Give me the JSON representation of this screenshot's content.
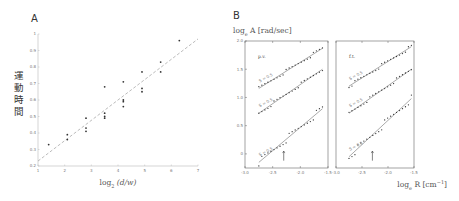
{
  "chart_data": [
    {
      "panel": "A",
      "type": "scatter",
      "title": "",
      "xlabel": "log2 (d/w)",
      "ylabel": "運動時間",
      "xlim": [
        1,
        7
      ],
      "ylim": [
        0.2,
        1.0
      ],
      "xticks": [
        "1",
        "2",
        "3",
        "4",
        "5",
        "6",
        "7"
      ],
      "yticks": [
        "0.2",
        "0.3",
        "0.4",
        "0.5",
        "0.6",
        "0.7",
        "0.8",
        "0.9",
        "1"
      ],
      "grid": false,
      "series": [
        {
          "name": "data",
          "points": [
            [
              1.4,
              0.33
            ],
            [
              2.1,
              0.39
            ],
            [
              2.1,
              0.36
            ],
            [
              2.8,
              0.49
            ],
            [
              2.8,
              0.43
            ],
            [
              2.8,
              0.41
            ],
            [
              3.5,
              0.68
            ],
            [
              3.5,
              0.52
            ],
            [
              3.5,
              0.5
            ],
            [
              3.5,
              0.49
            ],
            [
              4.2,
              0.71
            ],
            [
              4.2,
              0.6
            ],
            [
              4.2,
              0.59
            ],
            [
              4.2,
              0.56
            ],
            [
              4.9,
              0.77
            ],
            [
              4.9,
              0.67
            ],
            [
              4.9,
              0.65
            ],
            [
              5.6,
              0.83
            ],
            [
              5.6,
              0.77
            ],
            [
              6.3,
              0.96
            ]
          ]
        },
        {
          "name": "fit",
          "style": "dashed",
          "line": [
            [
              1,
              0.23
            ],
            [
              7,
              0.97
            ]
          ]
        }
      ]
    },
    {
      "panel": "B",
      "type": "scatter",
      "ylabel": "log_e A [rad/sec]",
      "xlabel": "log_e R [cm^-1]",
      "ylim": [
        -0.25,
        2.0
      ],
      "yticks": [
        "0",
        "0.5",
        "1.0",
        "1.5",
        "2.0"
      ],
      "subplots": [
        {
          "label": "p.v.",
          "xlim": [
            -3.0,
            -1.5
          ],
          "xticks": [
            "-3.0",
            "-2.5",
            "-2.0",
            "-1.5"
          ],
          "series": [
            {
              "name": "S = 0.5 (top)",
              "line": [
                [
                  -2.75,
                  1.16
                ],
                [
                  -1.6,
                  1.87
                ]
              ]
            },
            {
              "name": "S = 0.5 (mid)",
              "line": [
                [
                  -2.75,
                  0.72
                ],
                [
                  -1.6,
                  1.5
                ]
              ]
            },
            {
              "name": "S = 0.5 (bottom)",
              "line": [
                [
                  -2.75,
                  -0.15
                ],
                [
                  -1.6,
                  0.8
                ]
              ]
            }
          ],
          "annotation": "arrow at x≈-2.3"
        },
        {
          "label": "f.t.",
          "xlim": [
            -3.0,
            -1.5
          ],
          "xticks": [
            "-3.0",
            "-2.5",
            "-2.0",
            "-1.5"
          ],
          "series": [
            {
              "name": "S = 0.5 (top)",
              "line": [
                [
                  -2.75,
                  1.2
                ],
                [
                  -1.55,
                  1.9
                ]
              ]
            },
            {
              "name": "S = 0.5 (mid)",
              "line": [
                [
                  -2.75,
                  0.72
                ],
                [
                  -1.55,
                  1.5
                ]
              ]
            },
            {
              "name": "S = 0.5 (bottom)",
              "line": [
                [
                  -2.75,
                  -0.05
                ],
                [
                  -1.55,
                  0.98
                ]
              ]
            }
          ],
          "annotation": "arrow at x≈-2.3"
        }
      ]
    }
  ],
  "labels": {
    "panel_a": "A",
    "panel_b": "B",
    "a_xlabel_main": "log",
    "a_xlabel_sub": "2",
    "a_xlabel_rest": "(d/w)",
    "a_ylabel_chars": [
      "運",
      "動",
      "時",
      "間"
    ],
    "b_ylabel_main": "log",
    "b_ylabel_sub": "e",
    "b_ylabel_rest": "A [rad/sec]",
    "b_xlabel_main": "log",
    "b_xlabel_sub": "e",
    "b_xlabel_rest": "R [cm",
    "b_xlabel_sup": "−1",
    "b_xlabel_close": "]",
    "b_left_title": "p.v.",
    "b_right_title": "f.t.",
    "b_curve_tag": "S = 0.5"
  }
}
